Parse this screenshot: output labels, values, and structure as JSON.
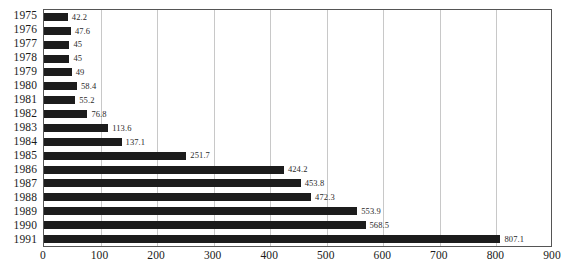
{
  "chart_data": {
    "type": "bar",
    "orientation": "horizontal",
    "title": "",
    "subtitle": "",
    "xlabel": "",
    "ylabel": "",
    "categories": [
      "1975",
      "1976",
      "1977",
      "1978",
      "1979",
      "1980",
      "1981",
      "1982",
      "1983",
      "1984",
      "1985",
      "1986",
      "1987",
      "1988",
      "1989",
      "1990",
      "1991"
    ],
    "values": [
      42.2,
      47.6,
      45,
      45,
      49,
      58.4,
      55.2,
      76.8,
      113.6,
      137.1,
      251.7,
      424.2,
      453.8,
      472.3,
      553.9,
      568.5,
      807.1
    ],
    "value_labels": [
      "42.2",
      "47.6",
      "45",
      "45",
      "49",
      "58.4",
      "55.2",
      "76.8",
      "113.6",
      "137.1",
      "251.7",
      "424.2",
      "453.8",
      "472.3",
      "553.9",
      "568.5",
      "807.1"
    ],
    "xlim": [
      0,
      900
    ],
    "x_ticks": [
      0,
      100,
      200,
      300,
      400,
      500,
      600,
      700,
      800,
      900
    ],
    "x_tick_labels": [
      "0",
      "100",
      "200",
      "300",
      "400",
      "500",
      "600",
      "700",
      "800",
      "900"
    ],
    "grid": {
      "vertical": true,
      "horizontal": false,
      "color": "#c8c8c8"
    },
    "legend": {
      "visible": false,
      "position": "none",
      "entries": []
    },
    "annotations": [],
    "colors": {
      "bar": "#1c1c1c",
      "plot_border": "#555555",
      "gridline": "#c8c8c8",
      "text": "#1a1a1a",
      "value_label": "#2a2a2a",
      "background": "#ffffff"
    }
  }
}
